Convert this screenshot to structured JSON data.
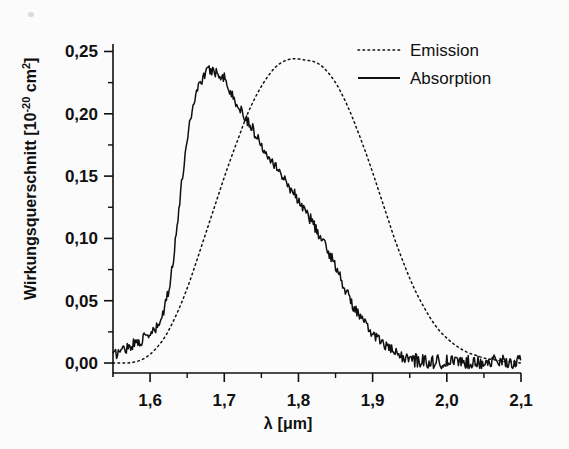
{
  "figure": {
    "background_color": "#fbfbfb",
    "ink_color": "#101010"
  },
  "axes": {
    "x_title_lambda": "λ",
    "x_title_unit": "[μm]",
    "y_title_main": "Wirkungsquerschnitt [10",
    "y_title_exp": "-20",
    "y_title_tail": " cm",
    "y_title_exp2": "2",
    "y_title_close": "]",
    "x_tick_labels": [
      "1,6",
      "1,7",
      "1,8",
      "1,9",
      "2,0",
      "2,1"
    ],
    "y_tick_labels": [
      "0,00",
      "0,05",
      "0,10",
      "0,15",
      "0,20",
      "0,25"
    ]
  },
  "legend": {
    "position": "top-right",
    "entries": [
      {
        "label": "Emission",
        "style": "dotted"
      },
      {
        "label": "Absorption",
        "style": "solid"
      }
    ]
  },
  "chart_data": {
    "type": "line",
    "title": "",
    "subtitle": "",
    "xlabel": "λ [μm]",
    "ylabel": "Wirkungsquerschnitt [10⁻²⁰ cm²]",
    "xlim": [
      1.55,
      2.1
    ],
    "ylim": [
      -0.008,
      0.256
    ],
    "x_ticks": [
      1.6,
      1.7,
      1.8,
      1.9,
      2.0,
      2.1
    ],
    "x_minor_ticks": [
      1.65,
      1.75,
      1.85,
      1.95,
      2.05
    ],
    "y_ticks": [
      0.0,
      0.05,
      0.1,
      0.15,
      0.2,
      0.25
    ],
    "y_minor_ticks": [
      0.025,
      0.075,
      0.125,
      0.175,
      0.225
    ],
    "grid": false,
    "legend_position": "top right",
    "noise_amplitude_absorption": 0.0045,
    "series": [
      {
        "name": "Absorption",
        "style": "solid",
        "color": "#101010",
        "peak_x": 1.685,
        "peak_y": 0.238,
        "x": [
          1.55,
          1.56,
          1.57,
          1.58,
          1.59,
          1.6,
          1.61,
          1.62,
          1.63,
          1.64,
          1.65,
          1.66,
          1.67,
          1.68,
          1.69,
          1.7,
          1.71,
          1.72,
          1.73,
          1.74,
          1.75,
          1.76,
          1.77,
          1.78,
          1.79,
          1.8,
          1.81,
          1.82,
          1.83,
          1.84,
          1.85,
          1.86,
          1.87,
          1.88,
          1.89,
          1.9,
          1.91,
          1.92,
          1.93,
          1.94,
          1.95,
          1.96,
          1.97,
          1.98,
          1.99,
          2.0,
          2.01,
          2.02,
          2.03,
          2.04,
          2.05,
          2.06,
          2.07,
          2.08,
          2.09,
          2.1
        ],
        "y": [
          0.006,
          0.01,
          0.013,
          0.016,
          0.019,
          0.023,
          0.029,
          0.045,
          0.078,
          0.13,
          0.18,
          0.212,
          0.228,
          0.235,
          0.233,
          0.229,
          0.215,
          0.205,
          0.196,
          0.186,
          0.175,
          0.167,
          0.158,
          0.148,
          0.14,
          0.131,
          0.121,
          0.112,
          0.1,
          0.09,
          0.078,
          0.064,
          0.05,
          0.04,
          0.031,
          0.024,
          0.018,
          0.013,
          0.008,
          0.005,
          0.003,
          0.002,
          0.002,
          0.001,
          0.001,
          0.001,
          0.001,
          0.001,
          0.001,
          0.001,
          0.001,
          0.001,
          0.001,
          0.001,
          0.001,
          0.001
        ]
      },
      {
        "name": "Emission",
        "style": "dotted",
        "color": "#101010",
        "peak_x": 1.825,
        "peak_y": 0.244,
        "x": [
          1.55,
          1.56,
          1.57,
          1.58,
          1.59,
          1.6,
          1.61,
          1.62,
          1.63,
          1.64,
          1.65,
          1.66,
          1.67,
          1.68,
          1.69,
          1.7,
          1.71,
          1.72,
          1.73,
          1.74,
          1.75,
          1.76,
          1.77,
          1.78,
          1.79,
          1.8,
          1.81,
          1.82,
          1.83,
          1.84,
          1.85,
          1.86,
          1.87,
          1.88,
          1.89,
          1.9,
          1.91,
          1.92,
          1.93,
          1.94,
          1.95,
          1.96,
          1.97,
          1.98,
          1.99,
          2.0,
          2.01,
          2.02,
          2.03,
          2.04,
          2.05,
          2.06,
          2.07,
          2.08,
          2.09,
          2.1
        ],
        "y": [
          0.0,
          0.0,
          0.0,
          0.001,
          0.003,
          0.007,
          0.013,
          0.021,
          0.032,
          0.045,
          0.06,
          0.077,
          0.095,
          0.113,
          0.131,
          0.149,
          0.166,
          0.182,
          0.198,
          0.211,
          0.222,
          0.231,
          0.238,
          0.242,
          0.244,
          0.244,
          0.243,
          0.242,
          0.239,
          0.233,
          0.225,
          0.214,
          0.201,
          0.186,
          0.17,
          0.153,
          0.135,
          0.117,
          0.099,
          0.083,
          0.068,
          0.055,
          0.044,
          0.034,
          0.026,
          0.02,
          0.015,
          0.011,
          0.008,
          0.006,
          0.004,
          0.003,
          0.002,
          0.001,
          0.001,
          0.0
        ]
      }
    ]
  }
}
